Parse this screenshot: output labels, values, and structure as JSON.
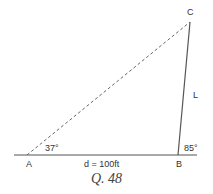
{
  "figure": {
    "caption": "Q. 48",
    "points": {
      "A": "A",
      "B": "B",
      "C": "C"
    },
    "angles": {
      "at_A": "37°",
      "at_B": "85°"
    },
    "sides": {
      "AB_label": "d = 100ft",
      "BC_label": "L"
    },
    "line_styles": {
      "AC": "dashed",
      "BC": "solid",
      "baseline": "solid"
    },
    "colors": {
      "line": "#555555",
      "dashed": "#666666",
      "text": "#333333"
    }
  }
}
